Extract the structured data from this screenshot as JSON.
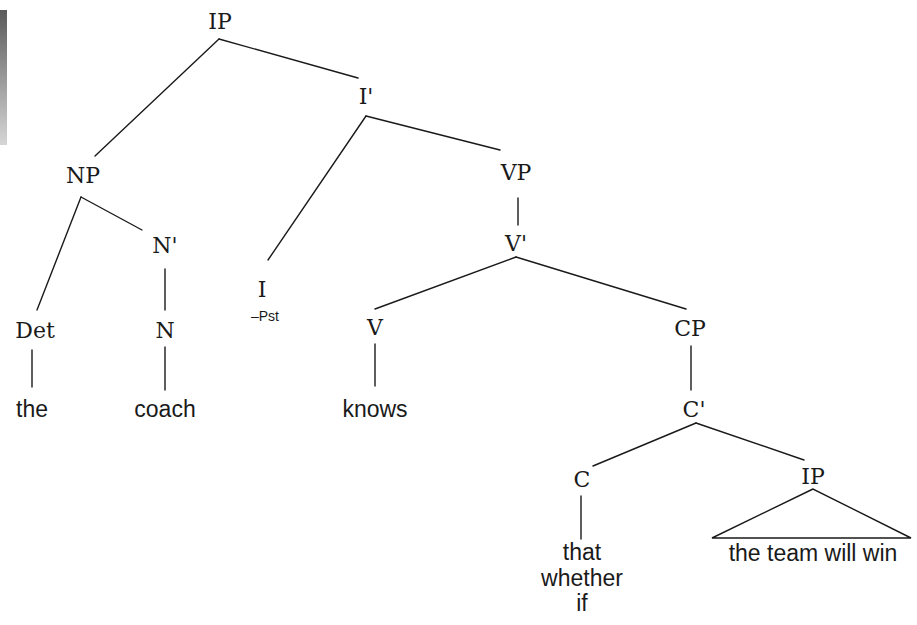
{
  "diagram": {
    "type": "syntax-tree",
    "edge_color": "#1a1a1a",
    "nodes": {
      "ip_root": {
        "label": "IP",
        "x": 220,
        "y": 22
      },
      "i_bar": {
        "label": "I'",
        "x": 366,
        "y": 97
      },
      "np": {
        "label": "NP",
        "x": 83,
        "y": 176
      },
      "n_bar": {
        "label": "N'",
        "x": 165,
        "y": 246
      },
      "i_head": {
        "label": "I",
        "x": 262,
        "y": 290,
        "feature": "–Pst",
        "feature_x": 265,
        "feature_y": 316
      },
      "vp": {
        "label": "VP",
        "x": 516,
        "y": 173
      },
      "v_bar": {
        "label": "V'",
        "x": 516,
        "y": 244
      },
      "det": {
        "label": "Det",
        "x": 35,
        "y": 331
      },
      "n_head": {
        "label": "N",
        "x": 165,
        "y": 331
      },
      "v_head": {
        "label": "V",
        "x": 375,
        "y": 328
      },
      "cp": {
        "label": "CP",
        "x": 690,
        "y": 329
      },
      "c_bar": {
        "label": "C'",
        "x": 694,
        "y": 410
      },
      "c_head": {
        "label": "C",
        "x": 582,
        "y": 480
      },
      "ip_embedded": {
        "label": "IP",
        "x": 813,
        "y": 477
      }
    },
    "terminals": {
      "the": {
        "text": "the",
        "x": 32,
        "y": 409
      },
      "coach": {
        "text": "coach",
        "x": 165,
        "y": 409
      },
      "knows": {
        "text": "knows",
        "x": 375,
        "y": 409
      },
      "complementizer_1": {
        "text": "that",
        "x": 582,
        "y": 552
      },
      "complementizer_2": {
        "text": "whether",
        "x": 582,
        "y": 578
      },
      "complementizer_3": {
        "text": "if",
        "x": 582,
        "y": 603
      },
      "embedded_clause": {
        "text": "the team will win",
        "x": 813,
        "y": 553
      }
    },
    "edges": [
      {
        "from": "IP",
        "to": "NP",
        "x1": 219,
        "y1": 39,
        "x2": 95,
        "y2": 156
      },
      {
        "from": "IP",
        "to": "I'",
        "x1": 219,
        "y1": 39,
        "x2": 358,
        "y2": 78
      },
      {
        "from": "I'",
        "to": "I",
        "x1": 366,
        "y1": 116,
        "x2": 268,
        "y2": 260
      },
      {
        "from": "I'",
        "to": "VP",
        "x1": 366,
        "y1": 116,
        "x2": 500,
        "y2": 150
      },
      {
        "from": "NP",
        "to": "Det",
        "x1": 81,
        "y1": 197,
        "x2": 37,
        "y2": 310
      },
      {
        "from": "NP",
        "to": "N'",
        "x1": 81,
        "y1": 197,
        "x2": 142,
        "y2": 230
      },
      {
        "from": "N'",
        "to": "N",
        "x1": 165,
        "y1": 269,
        "x2": 165,
        "y2": 310
      },
      {
        "from": "VP",
        "to": "V'",
        "x1": 518,
        "y1": 198,
        "x2": 518,
        "y2": 225
      },
      {
        "from": "V'",
        "to": "V",
        "x1": 516,
        "y1": 257,
        "x2": 375,
        "y2": 309
      },
      {
        "from": "V'",
        "to": "CP",
        "x1": 516,
        "y1": 257,
        "x2": 686,
        "y2": 309
      },
      {
        "from": "Det",
        "to": "the",
        "x1": 32,
        "y1": 350,
        "x2": 32,
        "y2": 387
      },
      {
        "from": "N",
        "to": "coach",
        "x1": 165,
        "y1": 347,
        "x2": 165,
        "y2": 390
      },
      {
        "from": "V",
        "to": "knows",
        "x1": 375,
        "y1": 344,
        "x2": 375,
        "y2": 386
      },
      {
        "from": "CP",
        "to": "C'",
        "x1": 691,
        "y1": 346,
        "x2": 691,
        "y2": 390
      },
      {
        "from": "C'",
        "to": "C",
        "x1": 696,
        "y1": 423,
        "x2": 593,
        "y2": 466
      },
      {
        "from": "C'",
        "to": "IP",
        "x1": 696,
        "y1": 423,
        "x2": 804,
        "y2": 460
      },
      {
        "from": "C",
        "to": "that/whether/if",
        "x1": 581,
        "y1": 496,
        "x2": 581,
        "y2": 539
      }
    ],
    "triangle": {
      "node": "IP",
      "apex_x": 813,
      "apex_y": 489,
      "left_x": 712,
      "right_x": 911,
      "base_y": 538
    }
  }
}
